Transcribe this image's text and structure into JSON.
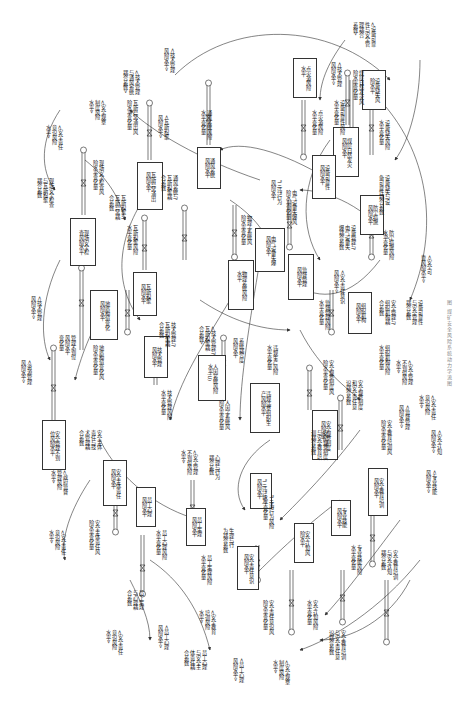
{
  "figure": {
    "caption": "图  煤矿安全风险系统动力学流图",
    "orientation": "rotated-90-clockwise"
  },
  "stocks": [
    {
      "id": "s1",
      "label": "现场安全检\n查风险水平"
    },
    {
      "id": "s2",
      "label": "瓦斯异常涌出\n风险水平"
    },
    {
      "id": "s3",
      "label": "通风系统\n风险水平"
    },
    {
      "id": "s4",
      "label": "点火源风险\n水平"
    },
    {
      "id": "s5",
      "label": "煤层自然发火\n风险水平"
    },
    {
      "id": "s6",
      "label": "设备缺失风\n险水平"
    },
    {
      "id": "s7",
      "label": "设备可靠性\n风险水平"
    },
    {
      "id": "s8",
      "label": "电气设备失爆\n风险水平"
    },
    {
      "id": "s9",
      "label": "防尘措施\n风险水平"
    },
    {
      "id": "s10",
      "label": "瓦斯积聚\n风险水平"
    },
    {
      "id": "s11",
      "label": "物理系统风险\n水平"
    },
    {
      "id": "s12",
      "label": "监督管理\n风险水平"
    },
    {
      "id": "s13",
      "label": "组织机构\n风险水平"
    },
    {
      "id": "s14",
      "label": "地质构造变化\n风险水平"
    },
    {
      "id": "s15",
      "label": "技术管理\n风险水平"
    },
    {
      "id": "s16",
      "label": "人因系统风险\n水平(U)"
    },
    {
      "id": "s17",
      "label": "违规违章组织生\n产风险水平"
    },
    {
      "id": "s18",
      "label": "安全规章制度\n风险水平"
    },
    {
      "id": "s19",
      "label": "安全管理不到\n位风险水平"
    },
    {
      "id": "s20",
      "label": "安全主体责任\n风险水平"
    },
    {
      "id": "s21",
      "label": "员工心理\n风险水平"
    },
    {
      "id": "s22",
      "label": "员工生理\n风险水平"
    },
    {
      "id": "s23",
      "label": "\"三违\"行为\n风险水平"
    },
    {
      "id": "s24",
      "label": "安全责任意识\n风险水平"
    },
    {
      "id": "s25",
      "label": "安全认知风\n险水平"
    },
    {
      "id": "s26",
      "label": "专业技能\n风险水平"
    },
    {
      "id": "s27",
      "label": "安全教育培训\n风险水平"
    }
  ],
  "rates": [
    {
      "id": "r1",
      "label": "现场安全检查风\n险水平变化量"
    },
    {
      "id": "r2",
      "label": "瓦斯异常涌出风\n险水平变化量"
    },
    {
      "id": "r3",
      "label": "通风系统风险\n水平变化量"
    },
    {
      "id": "r4",
      "label": "点火源风险\n水平变化量"
    },
    {
      "id": "r5",
      "label": "煤层自然发火风\n险水平变化量"
    },
    {
      "id": "r6",
      "label": "设备缺失风险\n水平变化量"
    },
    {
      "id": "r7",
      "label": "设备可靠性风险\n水平变化量"
    },
    {
      "id": "r8",
      "label": "电气设备失爆风\n险水平变化量"
    },
    {
      "id": "r9",
      "label": "防尘措施风险\n水平变化量"
    },
    {
      "id": "r10",
      "label": "瓦斯积聚风险\n水平变化量"
    },
    {
      "id": "r11",
      "label": "物理子系统风\n险水平变化量"
    },
    {
      "id": "r12",
      "label": "监督管理风险\n水平变化量"
    },
    {
      "id": "r13",
      "label": "组织机构风险\n水平变化量"
    },
    {
      "id": "r14",
      "label": "地质构造变化风\n险水平变化量"
    },
    {
      "id": "r15",
      "label": "技术管理风险\n水平变化量"
    },
    {
      "id": "r16",
      "label": "人因子系统风\n险水平变化量"
    },
    {
      "id": "r17",
      "label": "违规生产风险\n水平变化量"
    },
    {
      "id": "r18",
      "label": "安全规章制度风\n险水平变化量"
    },
    {
      "id": "r19",
      "label": "管理不到位\n风险水平\n变化量"
    },
    {
      "id": "r20",
      "label": "安全主体责任风\n险水平变化量"
    },
    {
      "id": "r21",
      "label": "员工心理风险\n水平变化量"
    },
    {
      "id": "r22",
      "label": "员工生理风险\n水平变化量"
    },
    {
      "id": "r23",
      "label": "\"三违\"行为风险\n水平变化量"
    },
    {
      "id": "r24",
      "label": "安全责任意识风\n险水平变化量"
    },
    {
      "id": "r25",
      "label": "安全认知风险\n水平变化量"
    },
    {
      "id": "r26",
      "label": "专业技能风险\n水平变化量"
    },
    {
      "id": "r27",
      "label": "安全教育培训风\n险水平变化量"
    }
  ],
  "auxiliaries": [
    {
      "id": "a1",
      "label": "<安全责任\n意识风险\n水平>"
    },
    {
      "id": "a2",
      "label": "<安全规章\n制度风险\n水平>"
    },
    {
      "id": "a3",
      "label": "现场安全检查\n与瓦斯积聚\n耦合系数"
    },
    {
      "id": "a4",
      "label": "<技术管理\n与通风系统\n耦合系数>"
    },
    {
      "id": "a5",
      "label": "<技术管理\n风险水平>"
    },
    {
      "id": "a6",
      "label": "<瓦斯积聚\n风险水平>"
    },
    {
      "id": "a7",
      "label": "通风系统与\n瓦斯积聚耦\n合系数"
    },
    {
      "id": "a8",
      "label": "<设备可靠\n性与安全管\n理耦合\n系数>"
    },
    {
      "id": "a9",
      "label": "<技术管理\n风险水平>"
    },
    {
      "id": "a10",
      "label": "\"三违\"行为\n风险水平"
    },
    {
      "id": "a11",
      "label": "设备缺失与设\n备可靠性耦合系数"
    },
    {
      "id": "a12",
      "label": "设备管理与\n电气设备失\n爆耦合系数"
    },
    {
      "id": "a13",
      "label": "<安全可\n靠风险水平>"
    },
    {
      "id": "a14",
      "label": "安全管理与\n组织机构耦\n合系数"
    },
    {
      "id": "a15",
      "label": "设备可靠性\n与安全管理\n耦合系数"
    },
    {
      "id": "a16",
      "label": "<安全责任意识\n风险水平>"
    },
    {
      "id": "a17",
      "label": "瓦斯积聚与\n瓦斯异常耦\n合系数"
    },
    {
      "id": "a18",
      "label": "<技术管理与\n瓦斯积聚耦\n合系数>"
    },
    {
      "id": "a19",
      "label": "系统耦合度\n风险水平"
    },
    {
      "id": "a20",
      "label": "技术管理与\n瓦斯积聚耦\n合系数"
    },
    {
      "id": "a21",
      "label": "<技术管理\n风险水平>"
    },
    {
      "id": "a22",
      "label": "<资源管理\n风险水平>"
    },
    {
      "id": "a23",
      "label": "<安全管理\n不到位风险\n水平>"
    },
    {
      "id": "a24",
      "label": "安全主体\n责任与技\n术管理耦\n合系数"
    },
    {
      "id": "a25",
      "label": "<政府监督\n管理风险\n水平>"
    },
    {
      "id": "a26",
      "label": "<安全责任\n意识风险\n水平>"
    },
    {
      "id": "a27",
      "label": "心理与行为\n耦合系数"
    },
    {
      "id": "a28",
      "label": "生理与行\n为耦合系数"
    },
    {
      "id": "a29",
      "label": "员工生理\n与心理耦\n合系数"
    },
    {
      "id": "a30",
      "label": "<员工心理\n风险水平>"
    },
    {
      "id": "a31",
      "label": "<安全教育\n培训风险\n水平>"
    },
    {
      "id": "a32",
      "label": "员工心理\n与安全主\n体责任耦\n合系数"
    },
    {
      "id": "a33",
      "label": "<员工心理\n风险水平>"
    },
    {
      "id": "a34",
      "label": "<安全规章\n制度风险\n水平>"
    },
    {
      "id": "a35",
      "label": "<安全责任\n意识风险\n水平>"
    },
    {
      "id": "a36",
      "label": "安全规章制度\n和安全责任意\n识耦合系数"
    },
    {
      "id": "a37",
      "label": "安全规章制度\n与安全教育培\n训耦合系数"
    },
    {
      "id": "a38",
      "label": "<安全责任\n意识风险\n水平>"
    },
    {
      "id": "a39",
      "label": "<安全认知\n风险水平>"
    },
    {
      "id": "a40",
      "label": "<专业技能\n风险水平>"
    },
    {
      "id": "a41",
      "label": "安全教育培训\n与安全认知\n耦合系数"
    },
    {
      "id": "a42",
      "label": "安全教育培训\n与安全责任意\n识耦合系数"
    },
    {
      "id": "a43",
      "label": "<安全管理\n不到位风险\n水平>"
    },
    {
      "id": "a44",
      "label": "<监督管理\n风险水平>"
    }
  ]
}
